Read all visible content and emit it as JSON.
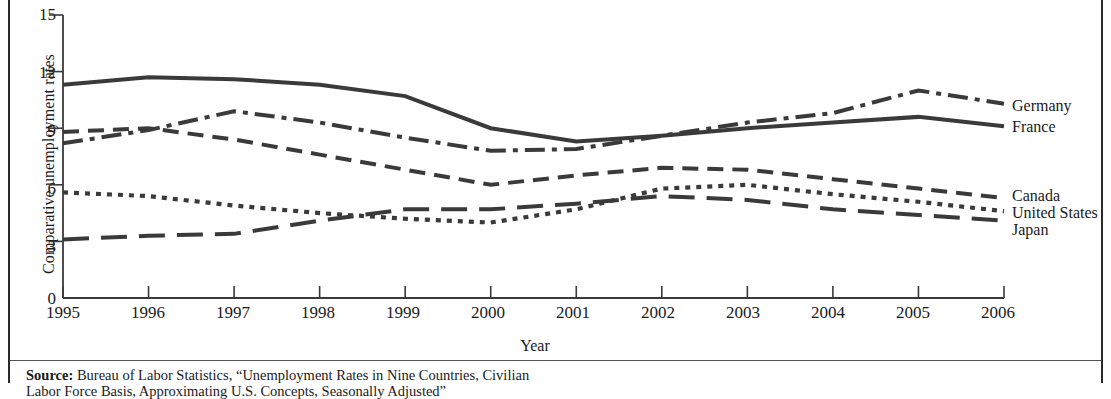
{
  "figure": {
    "ylabel": "Comparative unemployment rates",
    "xlabel": "Year",
    "source_prefix": "Source:",
    "source_text": " Bureau of Labor Statistics, “Unemployment Rates in Nine Countries, Civilian Labor Force Basis, Approximating U.S. Concepts, Seasonally Adjusted”"
  },
  "axes": {
    "y_ticks": [
      "15",
      "12",
      "9",
      "6",
      "3",
      "0"
    ],
    "x_ticks": [
      "1995",
      "1996",
      "1997",
      "1998",
      "1999",
      "2000",
      "2001",
      "2002",
      "2003",
      "2004",
      "2005",
      "2006"
    ],
    "ylim": [
      0,
      15
    ],
    "xlim": [
      1995,
      2006
    ],
    "grid": false,
    "ink": "#3a3a3a"
  },
  "chart_data": {
    "type": "line",
    "title": "",
    "xlabel": "Year",
    "ylabel": "Comparative unemployment rates",
    "ylim": [
      0,
      15
    ],
    "grid": false,
    "legend_position": "right-end-of-line",
    "x": [
      1995,
      1996,
      1997,
      1998,
      1999,
      2000,
      2001,
      2002,
      2003,
      2004,
      2005,
      2006
    ],
    "series": [
      {
        "name": "France",
        "style": "solid",
        "values": [
          11.3,
          11.7,
          11.6,
          11.3,
          10.7,
          9.0,
          8.3,
          8.6,
          9.0,
          9.3,
          9.6,
          9.1
        ]
      },
      {
        "name": "Germany",
        "style": "dash-dot",
        "values": [
          8.2,
          8.9,
          9.9,
          9.3,
          8.5,
          7.8,
          7.9,
          8.6,
          9.3,
          9.8,
          11.0,
          10.3
        ]
      },
      {
        "name": "Canada",
        "style": "dashed",
        "values": [
          8.8,
          9.0,
          8.4,
          7.6,
          6.8,
          6.0,
          6.5,
          6.9,
          6.8,
          6.3,
          5.8,
          5.3
        ]
      },
      {
        "name": "United States",
        "style": "dotted",
        "values": [
          5.6,
          5.4,
          4.9,
          4.5,
          4.2,
          4.0,
          4.7,
          5.8,
          6.0,
          5.5,
          5.1,
          4.6
        ]
      },
      {
        "name": "Japan",
        "style": "long-dash",
        "values": [
          3.1,
          3.3,
          3.4,
          4.1,
          4.7,
          4.7,
          5.0,
          5.4,
          5.2,
          4.7,
          4.4,
          4.1
        ]
      }
    ]
  },
  "series_labels": [
    {
      "name": "Germany",
      "y": 105
    },
    {
      "name": "France",
      "y": 126
    },
    {
      "name": "Canada",
      "y": 195
    },
    {
      "name": "United States",
      "y": 212
    },
    {
      "name": "Japan",
      "y": 229
    }
  ]
}
